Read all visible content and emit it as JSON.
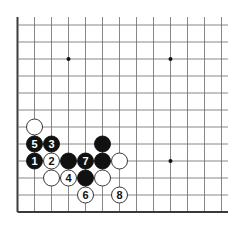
{
  "diagram": {
    "type": "go-board-fragment",
    "grid": {
      "origin_x": 17.5,
      "origin_y": 25,
      "spacing": 17,
      "cols": 13,
      "rows": 12,
      "right_edge_x": 228,
      "top_extension_y": 17,
      "edges": {
        "left": true,
        "bottom": true,
        "top": false,
        "right": false
      }
    },
    "colors": {
      "background": "#ffffff",
      "grid_line": "#6a6a6a",
      "edge_line": "#3a3a3a",
      "black_stone": "#111111",
      "white_stone": "#ffffff",
      "white_stone_outline": "#222222"
    },
    "star_points": [
      {
        "col": 3,
        "row": 2
      },
      {
        "col": 9,
        "row": 2
      },
      {
        "col": 9,
        "row": 8
      }
    ],
    "stones": [
      {
        "color": "white",
        "col": 1,
        "row": 6,
        "label": ""
      },
      {
        "color": "black",
        "col": 1,
        "row": 7,
        "label": "5"
      },
      {
        "color": "black",
        "col": 2,
        "row": 7,
        "label": "3"
      },
      {
        "color": "black",
        "col": 5,
        "row": 7,
        "label": ""
      },
      {
        "color": "black",
        "col": 1,
        "row": 8,
        "label": "1"
      },
      {
        "color": "white",
        "col": 2,
        "row": 8,
        "label": "2"
      },
      {
        "color": "black",
        "col": 3,
        "row": 8,
        "label": ""
      },
      {
        "color": "black",
        "col": 4,
        "row": 8,
        "label": "7"
      },
      {
        "color": "black",
        "col": 5,
        "row": 8,
        "label": ""
      },
      {
        "color": "white",
        "col": 6,
        "row": 8,
        "label": ""
      },
      {
        "color": "white",
        "col": 2,
        "row": 9,
        "label": ""
      },
      {
        "color": "white",
        "col": 3,
        "row": 9,
        "label": "4"
      },
      {
        "color": "black",
        "col": 4,
        "row": 9,
        "label": ""
      },
      {
        "color": "white",
        "col": 5,
        "row": 9,
        "label": ""
      },
      {
        "color": "white",
        "col": 4,
        "row": 10,
        "label": "6"
      },
      {
        "color": "white",
        "col": 6,
        "row": 10,
        "label": "8"
      }
    ]
  }
}
